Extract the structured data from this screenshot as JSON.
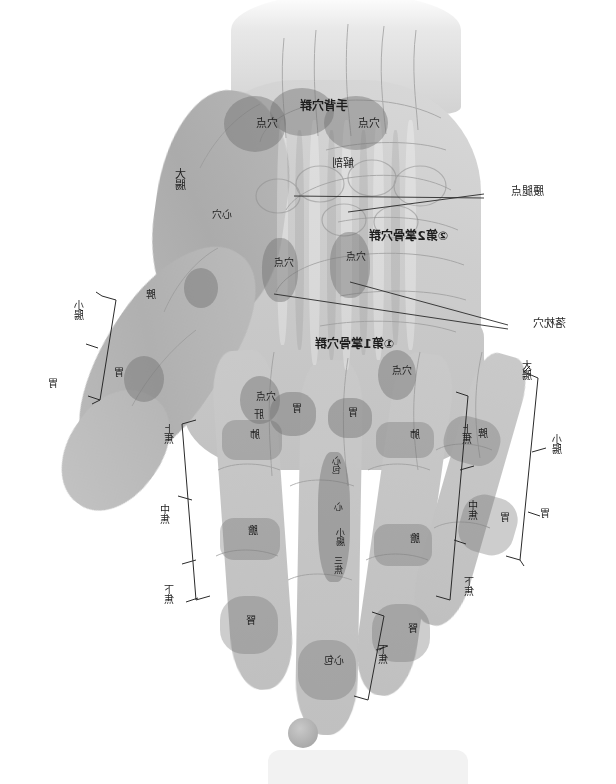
{
  "page": {
    "orientation": "mirrored",
    "background_color": "#ffffff"
  },
  "figure": {
    "caption_points": [
      "手背穴群"
    ]
  },
  "dorsum_labels": {
    "group_title": "手背穴群",
    "point_left": "穴点",
    "point_right": "穴点",
    "anatomy": "解剖",
    "heart_point": "心穴",
    "big_intestine": "大腸"
  },
  "palm_labels": {
    "metacarpal_group_2": "②第2掌骨穴群",
    "metacarpal_group_1": "①第1掌骨穴群",
    "point_a": "穴点",
    "point_b": "穴点",
    "point_c": "穴点",
    "point_d": "穴点"
  },
  "callouts": [
    {
      "id": "callout-yaotui",
      "text": "腰腿点"
    },
    {
      "id": "callout-luozhen",
      "text": "落枕穴"
    }
  ],
  "finger_labels": {
    "index_upper": "上焦",
    "index_mid": "中焦",
    "index_lower": "下焦",
    "gall": "膽",
    "liver": "肝",
    "lung": "肺",
    "spleen": "脾",
    "stomach": "胃",
    "kidney": "腎",
    "heart": "心",
    "small_intestine": "小腸",
    "large_intestine": "大腸"
  },
  "bracket_groups": {
    "left_outer": [
      {
        "label": "大腸"
      },
      {
        "label": "小腸"
      },
      {
        "label": "胃"
      }
    ],
    "left_inner": [
      {
        "label": "上焦"
      },
      {
        "label": "中焦"
      },
      {
        "label": "下焦"
      }
    ],
    "right_outer": [
      {
        "label": "小腸"
      },
      {
        "label": "胃"
      }
    ],
    "right_inner": [
      {
        "label": "上焦"
      },
      {
        "label": "中焦"
      },
      {
        "label": "下焦"
      }
    ]
  },
  "finger_zone_labels": {
    "ring_upper": "肺",
    "ring_mid": "膽",
    "ring_lower": "腎",
    "ring_tip": "肝",
    "little_upper": "脾",
    "little_lower": "胃",
    "index_upper": "肺",
    "index_mid": "膽",
    "index_lower": "腎",
    "index_tip": "肝",
    "middle_tip": "心包",
    "middle_strip": "心包・心・小腸"
  },
  "middle_finger_vertical": {
    "line1": "心包",
    "line2": "心",
    "line3": "小腸",
    "line4": "三焦"
  },
  "thumb_labels": {
    "upper": "脾",
    "lower": "胃"
  },
  "chrome": {
    "bottom_pill": "",
    "bottom_circle": "thumbnail"
  }
}
